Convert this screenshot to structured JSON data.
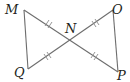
{
  "diagram": {
    "type": "geometry",
    "colors": {
      "line": "#6d6d6d",
      "label": "#231f20",
      "background": "#ffffff"
    },
    "points": [
      {
        "name": "M",
        "label": "M"
      },
      {
        "name": "N",
        "label": "N"
      },
      {
        "name": "O",
        "label": "O"
      },
      {
        "name": "Q",
        "label": "Q"
      },
      {
        "name": "P",
        "label": "P"
      }
    ],
    "segments": [
      "MQ",
      "OP",
      "MP",
      "OQ"
    ],
    "congruence_marks": [
      {
        "segment": "MN",
        "ticks": 2
      },
      {
        "segment": "NO",
        "ticks": 2
      },
      {
        "segment": "QN",
        "ticks": 2
      },
      {
        "segment": "NP",
        "ticks": 2
      }
    ]
  }
}
